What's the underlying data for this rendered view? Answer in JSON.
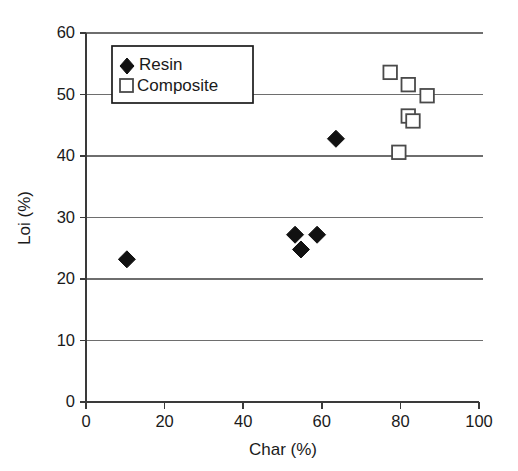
{
  "chart_data": {
    "type": "scatter",
    "title": "",
    "xlabel": "Char (%)",
    "ylabel": "Loi (%)",
    "xlim": [
      0,
      100
    ],
    "ylim": [
      0,
      60
    ],
    "xticks": [
      0,
      20,
      40,
      60,
      80,
      100
    ],
    "yticks": [
      0,
      10,
      20,
      30,
      40,
      50,
      60
    ],
    "xtick_labels": [
      "0",
      "20",
      "40",
      "60",
      "80",
      "100"
    ],
    "ytick_labels": [
      "0",
      "10",
      "20",
      "30",
      "40",
      "50",
      "60"
    ],
    "grid": "horizontal",
    "legend_position": "upper-left-inside",
    "series": [
      {
        "name": "Resin",
        "marker": "filled-diamond",
        "color": "#111111",
        "points": [
          {
            "x": 10.4,
            "y": 23.2
          },
          {
            "x": 53.2,
            "y": 27.2
          },
          {
            "x": 54.7,
            "y": 24.8
          },
          {
            "x": 58.8,
            "y": 27.2
          },
          {
            "x": 63.6,
            "y": 42.8
          }
        ]
      },
      {
        "name": "Composite",
        "marker": "open-square",
        "color": "#ffffff",
        "points": [
          {
            "x": 77.4,
            "y": 53.6
          },
          {
            "x": 82.0,
            "y": 51.6
          },
          {
            "x": 86.8,
            "y": 49.8
          },
          {
            "x": 82.0,
            "y": 46.5
          },
          {
            "x": 83.2,
            "y": 45.7
          },
          {
            "x": 79.6,
            "y": 40.6
          }
        ]
      }
    ]
  },
  "legend": {
    "entries": [
      {
        "label": "Resin",
        "marker": "filled-diamond"
      },
      {
        "label": "Composite",
        "marker": "open-square"
      }
    ]
  },
  "axes": {
    "x_title": "Char (%)",
    "y_title": "Loi (%)"
  },
  "colors": {
    "grid": "#6e6e6e",
    "axis": "#3a3a3a",
    "text": "#1a1a1a",
    "resin_marker": "#111111",
    "composite_marker_stroke": "#4a4a4a"
  }
}
